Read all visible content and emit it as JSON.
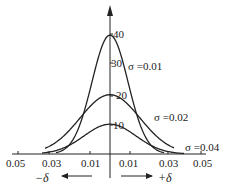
{
  "chart_data": {
    "type": "line",
    "title": "",
    "xlabel_left": "−δ",
    "xlabel_right": "+δ",
    "ylabel": "",
    "x_tick_labels": [
      "0.05",
      "0.03",
      "0.01",
      "0.01",
      "0.03",
      "0.05"
    ],
    "x_tick_values": [
      -0.05,
      -0.03,
      -0.01,
      0.01,
      0.03,
      0.05
    ],
    "y_tick_labels": [
      "10",
      "20",
      "30",
      "40"
    ],
    "y_tick_values": [
      10,
      20,
      30,
      40
    ],
    "ylim": [
      0,
      45
    ],
    "xlim": [
      -0.05,
      0.05
    ],
    "grid": false,
    "legend": "inline labels",
    "series": [
      {
        "name": "σ=0.01",
        "label": "σ =0.01",
        "sigma": 0.01,
        "peak": 39.9
      },
      {
        "name": "σ=0.02",
        "label": "σ =0.02",
        "sigma": 0.02,
        "peak": 19.9
      },
      {
        "name": "σ=0.04",
        "label": "σ =0.04",
        "sigma": 0.04,
        "peak": 10.0
      }
    ],
    "annotations": [
      "−δ ←",
      "→ +δ"
    ]
  }
}
